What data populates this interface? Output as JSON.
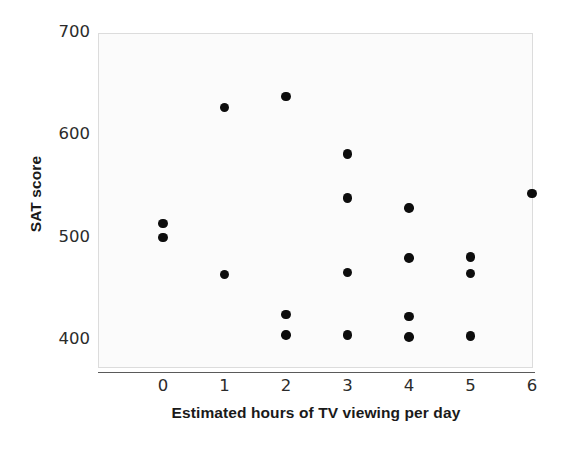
{
  "chart_data": {
    "type": "scatter",
    "title": "",
    "xlabel": "Estimated hours of TV viewing per day",
    "ylabel": "SAT score",
    "xlim": [
      -0.45,
      6.3
    ],
    "ylim": [
      372,
      700
    ],
    "xticks": [
      "0",
      "1",
      "2",
      "3",
      "4",
      "5",
      "6"
    ],
    "xtick_values": [
      0,
      1,
      2,
      3,
      4,
      5,
      6
    ],
    "yticks": [
      "700",
      "600",
      "500",
      "400"
    ],
    "ytick_values": [
      700,
      600,
      500,
      400
    ],
    "grid": false,
    "legend": null,
    "marker": "filled-circle",
    "marker_color": "#0d0d0d",
    "plot_background": "#fbfbfb",
    "frame_color": "#dcdcdc",
    "axis_color": "#5a5a5a",
    "x": [
      0,
      0,
      1,
      1,
      2,
      2,
      2,
      3,
      3,
      3,
      3,
      4,
      4,
      4,
      4,
      5,
      5,
      5,
      6
    ],
    "y": [
      514,
      500,
      627,
      464,
      638,
      425,
      405,
      582,
      539,
      466,
      405,
      529,
      480,
      423,
      403,
      481,
      465,
      404,
      543
    ],
    "points": [
      {
        "x": 0,
        "y": 514
      },
      {
        "x": 0,
        "y": 500
      },
      {
        "x": 1,
        "y": 627
      },
      {
        "x": 1,
        "y": 464
      },
      {
        "x": 2,
        "y": 638
      },
      {
        "x": 2,
        "y": 425
      },
      {
        "x": 2,
        "y": 405
      },
      {
        "x": 3,
        "y": 582
      },
      {
        "x": 3,
        "y": 539
      },
      {
        "x": 3,
        "y": 466
      },
      {
        "x": 3,
        "y": 405
      },
      {
        "x": 4,
        "y": 529
      },
      {
        "x": 4,
        "y": 480
      },
      {
        "x": 4,
        "y": 423
      },
      {
        "x": 4,
        "y": 403
      },
      {
        "x": 5,
        "y": 481
      },
      {
        "x": 5,
        "y": 465
      },
      {
        "x": 5,
        "y": 404
      },
      {
        "x": 6,
        "y": 543
      }
    ]
  }
}
